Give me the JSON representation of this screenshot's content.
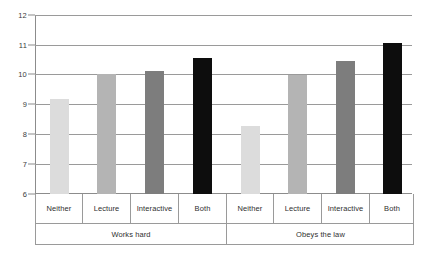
{
  "chart_data": {
    "type": "bar",
    "title": "",
    "subtitle": "",
    "xlabel": "",
    "ylabel": "",
    "ylim": [
      6,
      12
    ],
    "yticks": [
      6,
      7,
      8,
      9,
      10,
      11,
      12
    ],
    "ytick_labels": [
      "6",
      "7",
      "8",
      "9",
      "10",
      "11",
      "12"
    ],
    "grid": true,
    "legend": "none",
    "categories": [
      "Neither",
      "Lecture",
      "Interactive",
      "Both"
    ],
    "groups": [
      "Works hard",
      "Obeys the law"
    ],
    "series": [
      {
        "name": "Works hard",
        "values": [
          9.2,
          10.05,
          10.15,
          10.6
        ]
      },
      {
        "name": "Obeys the law",
        "values": [
          8.3,
          10.0,
          10.5,
          11.1
        ]
      }
    ],
    "bar_colors": [
      "#dcdcdc",
      "#b4b4b4",
      "#7d7d7d",
      "#0d0d0d"
    ],
    "bars": [
      {
        "group": "Works hard",
        "category": "Neither",
        "value": 9.2,
        "color": "#dcdcdc"
      },
      {
        "group": "Works hard",
        "category": "Lecture",
        "value": 10.05,
        "color": "#b4b4b4"
      },
      {
        "group": "Works hard",
        "category": "Interactive",
        "value": 10.15,
        "color": "#7d7d7d"
      },
      {
        "group": "Works hard",
        "category": "Both",
        "value": 10.6,
        "color": "#0d0d0d"
      },
      {
        "group": "Obeys the law",
        "category": "Neither",
        "value": 8.3,
        "color": "#dcdcdc"
      },
      {
        "group": "Obeys the law",
        "category": "Lecture",
        "value": 10.0,
        "color": "#b4b4b4"
      },
      {
        "group": "Obeys the law",
        "category": "Interactive",
        "value": 10.5,
        "color": "#7d7d7d"
      },
      {
        "group": "Obeys the law",
        "category": "Both",
        "value": 11.1,
        "color": "#0d0d0d"
      }
    ]
  },
  "axis": {
    "tick_12": "12",
    "tick_11": "11",
    "tick_10": "10",
    "tick_9": "9",
    "tick_8": "8",
    "tick_7": "7",
    "tick_6": "6"
  },
  "labels": {
    "g1_cat1": "Neither",
    "g1_cat2": "Lecture",
    "g1_cat3": "Interactive",
    "g1_cat4": "Both",
    "g2_cat1": "Neither",
    "g2_cat2": "Lecture",
    "g2_cat3": "Interactive",
    "g2_cat4": "Both",
    "group1": "Works hard",
    "group2": "Obeys the law"
  }
}
